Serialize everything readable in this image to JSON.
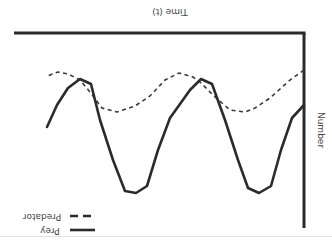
{
  "chart_data": {
    "type": "line",
    "title": "",
    "orientation_note": "figure rendered rotated 180 degrees",
    "xlabel": "Time (t)",
    "ylabel": "Number",
    "grid": false,
    "legend_position": "upper-left (appears bottom-left when rotated)",
    "x": [
      0,
      1,
      2,
      3,
      4,
      5,
      6,
      7,
      8,
      9,
      10,
      11,
      12,
      13,
      14,
      15,
      16,
      17,
      18,
      19,
      20,
      21,
      22,
      23,
      24,
      25,
      26
    ],
    "series": [
      {
        "name": "Prey",
        "style": "solid",
        "color": "#2b2b2b",
        "points_screen": [
          [
            304,
            105
          ],
          [
            292,
            118
          ],
          [
            281,
            150
          ],
          [
            271,
            186
          ],
          [
            259,
            193
          ],
          [
            248,
            188
          ],
          [
            238,
            160
          ],
          [
            225,
            120
          ],
          [
            212,
            84
          ],
          [
            201,
            79
          ],
          [
            190,
            90
          ],
          [
            170,
            118
          ],
          [
            158,
            150
          ],
          [
            147,
            186
          ],
          [
            136,
            193
          ],
          [
            125,
            191
          ],
          [
            113,
            160
          ],
          [
            100,
            120
          ],
          [
            91,
            84
          ],
          [
            80,
            79
          ],
          [
            68,
            88
          ],
          [
            57,
            105
          ],
          [
            47,
            127
          ]
        ]
      },
      {
        "name": "Predator",
        "style": "dashed",
        "color": "#3a3a3a",
        "points_screen": [
          [
            304,
            70
          ],
          [
            290,
            80
          ],
          [
            270,
            98
          ],
          [
            255,
            108
          ],
          [
            245,
            112
          ],
          [
            230,
            110
          ],
          [
            214,
            96
          ],
          [
            200,
            82
          ],
          [
            193,
            77
          ],
          [
            179,
            73
          ],
          [
            165,
            80
          ],
          [
            150,
            96
          ],
          [
            135,
            106
          ],
          [
            117,
            112
          ],
          [
            102,
            108
          ],
          [
            90,
            92
          ],
          [
            80,
            80
          ],
          [
            68,
            74
          ],
          [
            58,
            72
          ],
          [
            47,
            76
          ]
        ]
      }
    ],
    "axes_screen": {
      "horizontal": {
        "y": 33,
        "x1": 14,
        "x2": 304
      },
      "vertical": {
        "x": 304,
        "y1": 33,
        "y2": 228
      }
    }
  },
  "labels": {
    "x_axis": "Time (t)",
    "y_axis": "Number",
    "legend": [
      {
        "label": "Prey",
        "style": "solid"
      },
      {
        "label": "Predator",
        "style": "dashed"
      }
    ]
  }
}
